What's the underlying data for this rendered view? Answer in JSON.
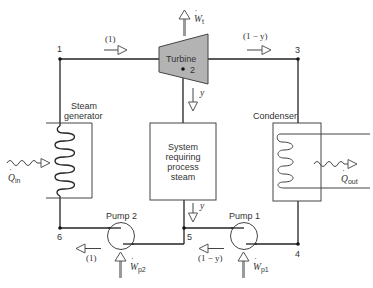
{
  "diagram": {
    "type": "cogeneration steam power cycle schematic",
    "components": {
      "turbine": {
        "label": "Turbine",
        "fill": "#b3b3b3"
      },
      "steam_generator": {
        "label_line1": "Steam",
        "label_line2": "generator"
      },
      "process_system": {
        "line1": "System",
        "line2": "requiring",
        "line3": "process",
        "line4": "steam"
      },
      "condenser": {
        "label": "Condenser"
      },
      "pump2": {
        "label": "Pump 2"
      },
      "pump1": {
        "label": "Pump 1"
      }
    },
    "states": {
      "s1": "1",
      "s2": "2",
      "s3": "3",
      "s4": "4",
      "s5": "5",
      "s6": "6"
    },
    "flows": {
      "top_left": "(1)",
      "top_right": "(1 − y)",
      "extract_down": "y",
      "process_out": "y",
      "bottom_left": "(1)",
      "bottom_right": "(1 − y)"
    },
    "energy": {
      "turbine_work": "W",
      "turbine_work_sub": "t",
      "heat_in": "Q",
      "heat_in_sub": "in",
      "heat_out": "Q",
      "heat_out_sub": "out",
      "pump2_work": "W",
      "pump2_work_sub": "p2",
      "pump1_work": "W",
      "pump1_work_sub": "p1"
    }
  }
}
